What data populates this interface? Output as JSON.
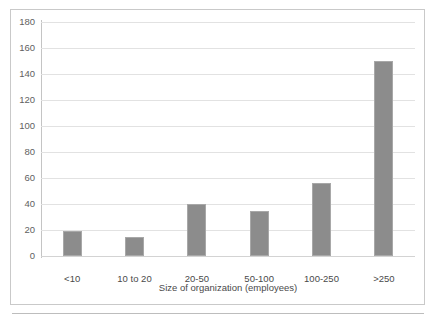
{
  "chart_data": {
    "type": "bar",
    "title": "",
    "subtitle": "",
    "xlabel": "Size of organization (employees)",
    "ylabel": "",
    "categories": [
      "<10",
      "10 to 20",
      "20-50",
      "50-100",
      "100-250",
      ">250"
    ],
    "values": [
      19,
      15,
      40,
      35,
      56,
      150
    ],
    "series": [
      {
        "name": "Count",
        "values": [
          19,
          15,
          40,
          35,
          56,
          150
        ]
      }
    ],
    "ylim": [
      0,
      180
    ],
    "ytick_values": [
      0,
      20,
      40,
      60,
      80,
      100,
      120,
      140,
      160,
      180
    ],
    "ytick_labels": [
      "0",
      "20",
      "40",
      "60",
      "80",
      "100",
      "120",
      "140",
      "160",
      "180"
    ],
    "grid": true,
    "grid_axis": "y",
    "legend": false,
    "legend_position": "none",
    "bar_color": "#8c8c8c",
    "bar_border_color": "#a8a8a8",
    "gridline_color": "#e2e2e2",
    "axis_color": "#c4c4c4",
    "frame_color": "#c9c9c9",
    "background_color": "#ffffff",
    "tick_label_color": "#5f5f5f",
    "axis_title_color": "#4a4a4a"
  }
}
